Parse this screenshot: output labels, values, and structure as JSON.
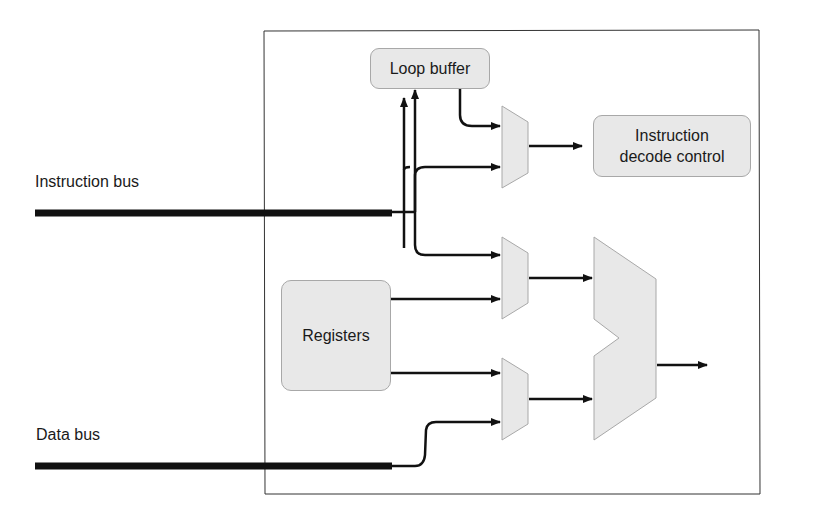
{
  "diagram": {
    "labels": {
      "instruction_bus": "Instruction bus",
      "data_bus": "Data bus"
    },
    "blocks": {
      "loop_buffer": "Loop buffer",
      "instruction_decode_control_line1": "Instruction",
      "instruction_decode_control_line2": "decode control",
      "registers": "Registers"
    },
    "colors": {
      "block_fill": "#e8e8e8",
      "block_border": "#a8a8a8",
      "wire": "#111111",
      "frame": "#333333"
    }
  }
}
